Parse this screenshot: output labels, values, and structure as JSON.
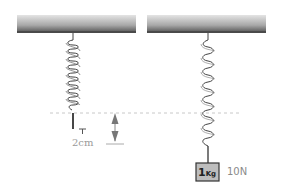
{
  "diagram": {
    "type": "spring-extension",
    "left_setup": {
      "state": "unloaded spring",
      "extension_label": "2cm"
    },
    "right_setup": {
      "state": "loaded spring",
      "mass_label_number": "1",
      "mass_label_unit": "Kg",
      "force_label": "10N"
    },
    "colors": {
      "ceiling_top": "#d8d8d8",
      "ceiling_bottom": "#555555",
      "spring": "#444444",
      "dashed_line": "#c8c8c8",
      "arrow": "#777777",
      "weight_fill": "#bdbdbd",
      "weight_border": "#333333",
      "label_text": "#999999"
    }
  }
}
